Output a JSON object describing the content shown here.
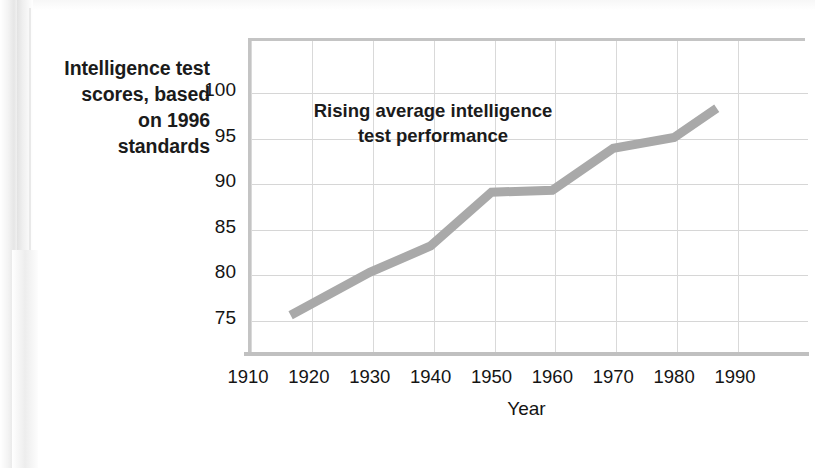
{
  "caption": {
    "lines": [
      "Intelligence test",
      "scores, based",
      "on 1996",
      "standards"
    ]
  },
  "annotation": {
    "line1": "Rising average intelligence",
    "line2": "test performance"
  },
  "colors": {
    "line": "#a9a9a9",
    "grid": "#d6d6d6",
    "axis": "#c4c4c4",
    "text": "#141414",
    "background": "#ffffff"
  },
  "chart_data": {
    "type": "line",
    "title": "Rising average intelligence test performance",
    "xlabel": "Year",
    "ylabel": "Intelligence test scores, based on 1996 standards",
    "xlim": [
      1905,
      1996
    ],
    "ylim": [
      72,
      101.5
    ],
    "xticks": [
      1910,
      1920,
      1930,
      1940,
      1950,
      1960,
      1970,
      1980,
      1990
    ],
    "yticks": [
      75,
      80,
      85,
      90,
      95,
      100
    ],
    "xtick_labels": [
      "1910",
      "1920",
      "1930",
      "1940",
      "1950",
      "1960",
      "1970",
      "1980",
      "1990"
    ],
    "ytick_labels": [
      "75",
      "80",
      "85",
      "90",
      "95",
      "100"
    ],
    "grid": true,
    "legend": false,
    "series": [
      {
        "name": "Average intelligence test score",
        "x": [
          1917,
          1930,
          1940,
          1950,
          1960,
          1970,
          1980,
          1987
        ],
        "values": [
          75.3,
          80.0,
          82.9,
          88.8,
          89.0,
          93.6,
          94.8,
          98.0
        ]
      }
    ]
  }
}
